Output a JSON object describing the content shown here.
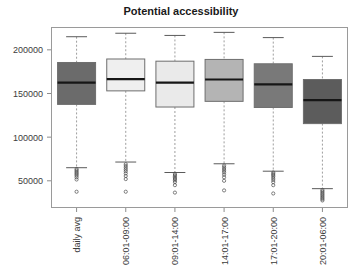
{
  "chart_data": {
    "type": "box",
    "title": "Potential accessibility",
    "xlabel": "",
    "ylabel": "",
    "grid": false,
    "legend": "none",
    "ylim": [
      20000,
      225000
    ],
    "ytick_values": [
      50000,
      100000,
      150000,
      200000
    ],
    "ytick_labels": [
      "50000",
      "100000",
      "150000",
      "200000"
    ],
    "categories": [
      "daily avg",
      "06:01-09:00",
      "09:01-14:00",
      "14:01-17:00",
      "17:01-20:00",
      "20:01-06:00"
    ],
    "boxes": [
      {
        "label": "daily avg",
        "whisker_high": 215000,
        "q3": 185500,
        "median": 162500,
        "q1": 137500,
        "whisker_low": 65000,
        "fill": "#6b6b6b",
        "outliers": [
          63500,
          62000,
          60500,
          59000,
          57500,
          56000,
          54000,
          51500,
          37500
        ]
      },
      {
        "label": "06:01-09:00",
        "whisker_high": 219000,
        "q3": 189500,
        "median": 166500,
        "q1": 153000,
        "whisker_low": 71500,
        "fill": "#efefef",
        "outliers": [
          69000,
          67000,
          65000,
          63000,
          61000,
          58500,
          55500,
          52000,
          37500
        ]
      },
      {
        "label": "09:01-14:00",
        "whisker_high": 216500,
        "q3": 187000,
        "median": 162500,
        "q1": 134500,
        "whisker_low": 59500,
        "fill": "#eaeaea",
        "outliers": [
          58000,
          56500,
          55000,
          53500,
          52000,
          50500,
          48500,
          45000,
          36500
        ]
      },
      {
        "label": "14:01-17:00",
        "whisker_high": 220000,
        "q3": 189000,
        "median": 166000,
        "q1": 141000,
        "whisker_low": 69500,
        "fill": "#b4b4b4",
        "outliers": [
          67500,
          65500,
          63500,
          61500,
          59500,
          57000,
          54000,
          50000,
          39000
        ]
      },
      {
        "label": "17:01-20:00",
        "whisker_high": 214000,
        "q3": 184000,
        "median": 160500,
        "q1": 134000,
        "whisker_low": 61000,
        "fill": "#797979",
        "outliers": [
          59500,
          58000,
          56500,
          55000,
          53000,
          51000,
          48500,
          45000,
          35500
        ]
      },
      {
        "label": "20:01-06:00",
        "whisker_high": 192500,
        "q3": 166000,
        "median": 142500,
        "q1": 115500,
        "whisker_low": 41000,
        "fill": "#5c5c5c",
        "outliers": [
          39500,
          38000,
          36500,
          35000,
          33500,
          32000,
          30500,
          29000,
          27500
        ]
      }
    ],
    "colors": {
      "frame": "#9a9a9a",
      "median": "#161616",
      "whisker": "#9e9e9e",
      "tick": "#8c8c8c",
      "text": "#3c3c3c",
      "title": "#1a1a1a",
      "background": "#ffffff"
    }
  }
}
